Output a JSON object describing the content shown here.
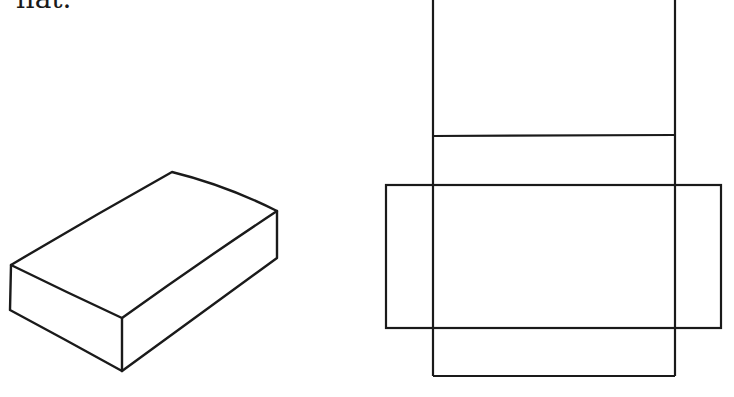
{
  "caption": {
    "text": "flat."
  },
  "figures": {
    "box": {
      "label": "3D rectangular box",
      "stroke": "#1a1a1a",
      "points": {
        "top_left": [
          11,
          265
        ],
        "top_back": [
          172,
          172
        ],
        "top_right": [
          277,
          211
        ],
        "front_corner": [
          122,
          318
        ],
        "bottom_front": [
          122,
          371
        ],
        "bottom_left": [
          10,
          310
        ],
        "bottom_right": [
          277,
          258
        ]
      }
    },
    "net": {
      "label": "unfolded box net",
      "stroke": "#1a1a1a",
      "column": {
        "x1": 433,
        "x2": 675,
        "top": 0,
        "bottom": 376
      },
      "fold_line_y": 136,
      "wide_rect": {
        "x1": 386,
        "x2": 721,
        "y1": 185,
        "y2": 328
      }
    }
  }
}
